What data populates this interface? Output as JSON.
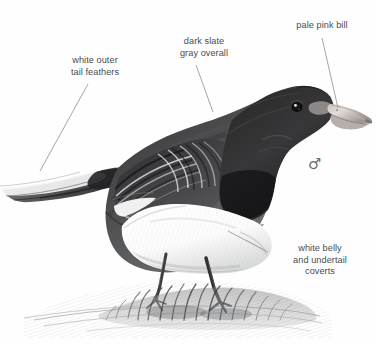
{
  "plate": {
    "subject": "dark-eyed-junco-male",
    "background_color": "#fefefe",
    "label_color": "#4c4c4c",
    "leader_line_color": "#8e8e8e",
    "sex_symbol": "♂",
    "sex_symbol_label": "male-symbol"
  },
  "callouts": [
    {
      "id": "white-outer-tail-feathers",
      "text": "white outer\ntail feathers",
      "align": "center",
      "leader": {
        "x1": 40,
        "y1": 171,
        "x2": 88,
        "y2": 84
      }
    },
    {
      "id": "dark-slate-gray-overall",
      "text": "dark slate\ngray overall",
      "align": "center",
      "leader": {
        "x1": 213,
        "y1": 112,
        "x2": 196,
        "y2": 65
      }
    },
    {
      "id": "pale-pink-bill",
      "text": "pale pink bill",
      "align": "center",
      "leader": {
        "x1": 338,
        "y1": 108,
        "x2": 322,
        "y2": 38
      }
    },
    {
      "id": "white-belly-and-undertail-coverts",
      "text": "white belly\nand undertail\ncoverts",
      "align": "center",
      "leader": {
        "x1": 228,
        "y1": 231,
        "x2": 268,
        "y2": 252
      }
    }
  ],
  "artwork": {
    "type": "pencil-illustration",
    "plumage": {
      "head_and_hood": "dark slate gray / blackish",
      "back_and_wings": "dark slate gray with pale feather edging",
      "belly": "white",
      "undertail_coverts": "white",
      "outer_tail_feathers": "white",
      "bill": "pale pink",
      "legs": "dark gray",
      "eye": "dark with highlight"
    },
    "ground": "sketched grass tuft and shadow"
  }
}
